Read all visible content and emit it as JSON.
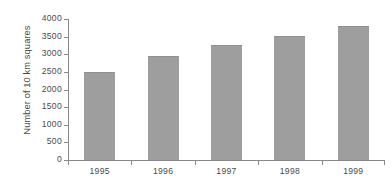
{
  "chart_data": {
    "type": "bar",
    "title": "",
    "subtitle": "",
    "xlabel": "",
    "ylabel": "Number of 10 km squares",
    "categories": [
      "1995",
      "1996",
      "1997",
      "1998",
      "1999"
    ],
    "values": [
      2490,
      2950,
      3250,
      3530,
      3800
    ],
    "series": [
      {
        "name": "Number of 10 km squares",
        "values": [
          2490,
          2950,
          3250,
          3530,
          3800
        ]
      }
    ],
    "ylim": [
      0,
      4000
    ],
    "ytick_labels": [
      "0",
      "500",
      "1000",
      "1500",
      "2000",
      "2500",
      "3000",
      "3500",
      "4000"
    ],
    "ytick_values": [
      0,
      500,
      1000,
      1500,
      2000,
      2500,
      3000,
      3500,
      4000
    ],
    "xtick_labels": [
      "1995",
      "1996",
      "1997",
      "1998",
      "1999"
    ],
    "grid": false,
    "legend": "none",
    "colors": {
      "bar_fill": "#9e9e9e",
      "bar_edge": "#8f8f8f",
      "axis": "#888888",
      "text": "#4a4a4a",
      "background": "#ffffff"
    }
  }
}
